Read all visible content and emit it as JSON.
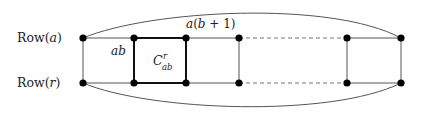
{
  "diagram": {
    "row_labels": {
      "top": {
        "prefix": "Row(",
        "var": "a",
        "suffix": ")"
      },
      "bottom": {
        "prefix": "Row(",
        "var": "r",
        "suffix": ")"
      }
    },
    "edge_labels": {
      "ab": "ab",
      "ab_plus_1": {
        "a": "a",
        "open": "(",
        "b": "b",
        "plus": " + 1",
        "close": ")"
      }
    },
    "cell_label": {
      "base": "C",
      "sup": "r",
      "sub": "ab"
    },
    "nodes_x": [
      83,
      134,
      186,
      239,
      347,
      401
    ],
    "row_y": {
      "top": 38,
      "bottom": 83
    },
    "colors": {
      "line": "#555555",
      "thick": "#111111",
      "node": "#000000",
      "dashed": "#777777"
    }
  }
}
